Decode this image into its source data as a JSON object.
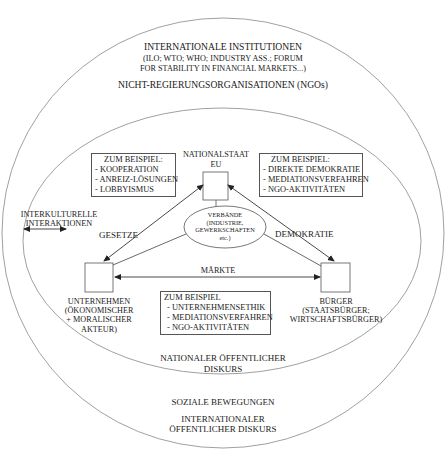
{
  "page": {
    "header_left": "",
    "header_center": ""
  },
  "outer_circle": {
    "title": "INTERNATIONALE INSTITUTIONEN",
    "subtitle_line1": "(ILO; WTO; WHO; INDUSTRY ASS.; FORUM",
    "subtitle_line2": "FOR STABILITY IN FINANCIAL MARKETS...)",
    "ngo_label": "NICHT-REGIERUNGSORGANISATIONEN (NGOs)",
    "intercultural_line1": "INTERKULTURELLE",
    "intercultural_line2": "INTERAKTIONEN",
    "social_movements": "SOZIALE BEWEGUNGEN",
    "intl_discourse_line1": "INTERNATIONALER",
    "intl_discourse_line2": "ÖFFENTLICHER DISKURS"
  },
  "inner_circle": {
    "national_discourse_line1": "NATIONALER ÖFFENTLICHER",
    "national_discourse_line2": "DISKURS"
  },
  "nodes": {
    "state": {
      "line1": "NATIONALSTAAT",
      "line2": "EU"
    },
    "company": {
      "line1": "UNTERNEHMEN",
      "line2": "(ÖKONOMISCHER",
      "line3": "+ MORALISCHER",
      "line4": "AKTEUR)"
    },
    "citizen": {
      "line1": "BÜRGER",
      "line2": "(STAATSBÜRGER;",
      "line3": "WIRTSCHAFTSBÜRGER)"
    },
    "associations": {
      "line1": "VERBÄNDE",
      "line2": "(INDUSTRIE,",
      "line3": "GEWERKSCHAFTEN",
      "line4": "etc.)"
    }
  },
  "edges": {
    "left": "GESETZE",
    "right": "DEMOKRATIE",
    "bottom": "MÄRKTE"
  },
  "example_boxes": {
    "left": {
      "heading": "ZUM BEISPIEL:",
      "items": [
        "- KOOPERATION",
        "- ANREIZ-LÖSUNGEN",
        "- LOBBYISMUS"
      ]
    },
    "right": {
      "heading": "ZUM BEISPIEL:",
      "items": [
        "- DIREKTE DEMOKRATIE",
        "- MEDIATIONSVERFAHREN",
        "- NGO-AKTIVITÄTEN"
      ]
    },
    "bottom": {
      "heading": "ZUM BEISPIEL",
      "items": [
        "- UNTERNEHMENSETHIK",
        "- MEDIATIONSVERFAHREN",
        "- NGO-AKTIVITÄTEN"
      ]
    }
  },
  "colors": {
    "line": "#555555",
    "circle": "#777777",
    "text": "#1a1a1a",
    "background": "#ffffff"
  }
}
